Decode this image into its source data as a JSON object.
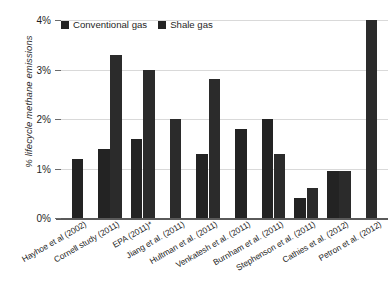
{
  "chart_data": {
    "type": "bar",
    "title": "",
    "xlabel": "",
    "ylabel": "% lifecycle methane emissions",
    "ylim": [
      0,
      4
    ],
    "yticks": [
      "0%",
      "1%",
      "2%",
      "3%",
      "4%"
    ],
    "ytick_values": [
      0,
      1,
      2,
      3,
      4
    ],
    "grid": "horizontal",
    "legend_position": "top-left",
    "categories": [
      "Hayhoe et al (2002)",
      "Cornell study (2011)",
      "EPA (2011)*",
      "Jiang et al. (2011)",
      "Hultman et al. (2011)",
      "Venkatesh et al. (2011)",
      "Burnham et al. (2011)",
      "Stephenson et al. (2011)",
      "Cathies et al. (2012)",
      "Petron et al. (2012)"
    ],
    "series": [
      {
        "name": "Conventional gas",
        "color": "#232323",
        "values": [
          1.2,
          1.4,
          1.6,
          null,
          1.3,
          1.8,
          2.0,
          0.4,
          0.95,
          null
        ]
      },
      {
        "name": "Shale gas",
        "color": "#2b2b2b",
        "values": [
          null,
          3.3,
          3.0,
          2.0,
          2.8,
          null,
          1.3,
          0.6,
          0.95,
          4.0
        ]
      }
    ]
  },
  "legend": {
    "items": [
      {
        "label": "Conventional gas",
        "swatch_name": "legend-swatch-conventional-gas"
      },
      {
        "label": "Shale gas",
        "swatch_name": "legend-swatch-shale-gas"
      }
    ]
  }
}
